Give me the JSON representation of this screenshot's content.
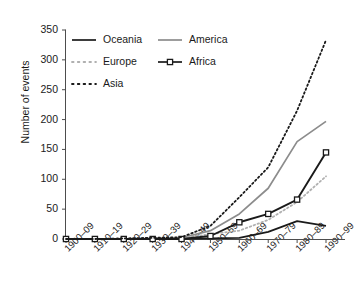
{
  "chart_data": {
    "type": "line",
    "title": "",
    "xlabel": "",
    "ylabel": "Number of events",
    "categories": [
      "1900–09",
      "1910–19",
      "1920–29",
      "1930–39",
      "1940–49",
      "1950–59",
      "1960–69",
      "1970–79",
      "1980–89",
      "1990–99"
    ],
    "ylim": [
      0,
      350
    ],
    "yticks": [
      0,
      50,
      100,
      150,
      200,
      250,
      300,
      350
    ],
    "ytick_labels": [
      "0",
      "50",
      "100",
      "150",
      "200",
      "250",
      "300",
      "350"
    ],
    "grid": false,
    "legend_position": "upper-left-inside",
    "series": [
      {
        "name": "Oceania",
        "color": "#1a1a1a",
        "style": "solid",
        "marker": "none",
        "values": [
          0,
          0,
          0,
          0,
          0,
          1,
          2,
          12,
          30,
          22
        ]
      },
      {
        "name": "America",
        "color": "#8c8c8c",
        "style": "solid",
        "marker": "none",
        "values": [
          0,
          0,
          0,
          1,
          2,
          14,
          42,
          85,
          163,
          197
        ]
      },
      {
        "name": "Europe",
        "color": "#b0b0b0",
        "style": "dotted",
        "marker": "none",
        "values": [
          0,
          0,
          0,
          1,
          2,
          8,
          14,
          32,
          62,
          105
        ]
      },
      {
        "name": "Africa",
        "color": "#1a1a1a",
        "style": "solid",
        "marker": "square",
        "values": [
          0,
          0,
          0,
          0,
          0,
          5,
          28,
          42,
          66,
          145
        ]
      },
      {
        "name": "Asia",
        "color": "#1a1a1a",
        "style": "dotted",
        "marker": "none",
        "values": [
          0,
          0,
          1,
          2,
          3,
          22,
          70,
          120,
          215,
          333
        ]
      }
    ]
  },
  "legend": {
    "entries": [
      {
        "label": "Oceania"
      },
      {
        "label": "America"
      },
      {
        "label": "Europe"
      },
      {
        "label": "Africa"
      },
      {
        "label": "Asia"
      }
    ]
  },
  "axes": {
    "y_title": "Number of events"
  }
}
